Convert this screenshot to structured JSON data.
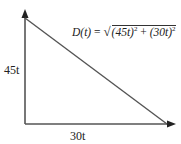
{
  "diagram": {
    "type": "right-triangle-distance",
    "formula": {
      "lhs": "D(t)",
      "equals": "=",
      "sqrt_symbol": "√",
      "term1": "(45t)",
      "plus": "+",
      "term2": "(30t)",
      "exponent": "2"
    },
    "labels": {
      "vertical_side": "45t",
      "horizontal_side": "30t"
    },
    "colors": {
      "lines": "#555555",
      "text": "#222222",
      "background": "#ffffff"
    }
  }
}
